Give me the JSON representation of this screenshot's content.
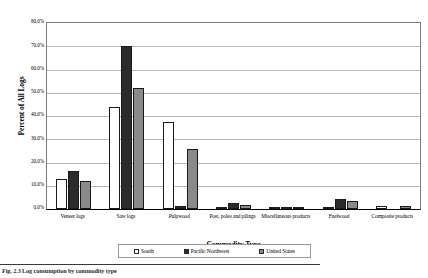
{
  "chart_data": {
    "type": "bar",
    "title": "",
    "xlabel": "Commodity Type",
    "ylabel": "Percent of All Logs",
    "ylim": [
      0,
      80
    ],
    "ytick_labels": [
      "80.0%",
      "70.0%",
      "60.0%",
      "50.0%",
      "40.0%",
      "30.0%",
      "20.0%",
      "10.0%",
      "0.0%"
    ],
    "ytick_values": [
      80,
      70,
      60,
      50,
      40,
      30,
      20,
      10,
      0
    ],
    "grid": true,
    "legend_position": "bottom",
    "categories": [
      "Veneer logs",
      "Saw logs",
      "Pulpwood",
      "Post, poles and pilings",
      "Miscellaneous products",
      "Fuelwood",
      "Composite products"
    ],
    "series": [
      {
        "name": "South",
        "color": "#ffffff",
        "values": [
          13.0,
          44.0,
          37.5,
          0.8,
          0.4,
          1.0,
          1.5
        ]
      },
      {
        "name": "Pacific Northwest",
        "color": "#2b2b2b",
        "values": [
          16.5,
          70.0,
          1.5,
          2.8,
          0.3,
          4.2,
          0.0
        ]
      },
      {
        "name": "United States",
        "color": "#8a8a8a",
        "values": [
          12.0,
          52.0,
          26.0,
          1.8,
          0.5,
          3.4,
          1.2
        ]
      }
    ]
  },
  "legend": {
    "entries": [
      {
        "label": "South"
      },
      {
        "label": "Pacific Northwest"
      },
      {
        "label": "United States"
      }
    ]
  },
  "caption": {
    "text": "Fig. 2.3  Log consumption by commodity type"
  }
}
